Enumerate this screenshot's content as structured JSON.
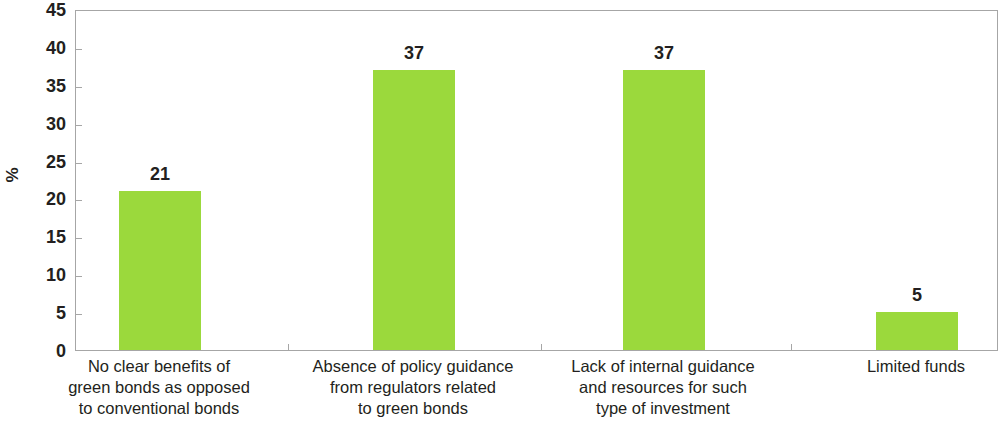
{
  "chart_data": {
    "type": "bar",
    "title": "",
    "subtitle": "",
    "xlabel": "",
    "ylabel": "%",
    "ylim": [
      0,
      45
    ],
    "ytick_step": 5,
    "yticks": [
      "45",
      "40",
      "35",
      "30",
      "25",
      "20",
      "15",
      "10",
      "5",
      "0"
    ],
    "grid": false,
    "legend": false,
    "legend_position": "none",
    "bar_color": "#9BD93C",
    "categories": [
      "No clear benefits of green bonds as opposed to conventional bonds",
      "Absence of policy guidance from regulators related to green bonds",
      "Lack of internal guidance and resources for such type of investment",
      "Limited funds"
    ],
    "category_lines": [
      [
        "No clear benefits of",
        "green bonds as opposed",
        "to conventional bonds"
      ],
      [
        "Absence of policy guidance",
        "from regulators related",
        "to green bonds"
      ],
      [
        "Lack of internal guidance",
        "and resources for such",
        "type of investment"
      ],
      [
        "Limited funds"
      ]
    ],
    "values": [
      21,
      37,
      37,
      5
    ],
    "value_labels": [
      "21",
      "37",
      "37",
      "5"
    ]
  },
  "axis": {
    "y_title": "%",
    "frame_color": "#a6a6a6"
  }
}
